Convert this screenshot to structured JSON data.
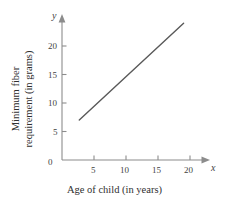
{
  "chart_data": {
    "type": "line",
    "title": "",
    "subtitle": "",
    "xlabel": "Age of child (in years)",
    "ylabel": "Minimum fiber requirement (in grams)",
    "x_var_symbol": "x",
    "y_var_symbol": "y",
    "xlim": [
      0,
      21.5
    ],
    "ylim": [
      0,
      25.5
    ],
    "x_ticks": [
      5,
      10,
      15,
      20
    ],
    "x_tick_labels": [
      "5",
      "10",
      "15",
      "20"
    ],
    "y_ticks": [
      5,
      10,
      15,
      20
    ],
    "y_tick_labels": [
      "5",
      "10",
      "15",
      "20"
    ],
    "origin_label": "0",
    "grid": false,
    "legend": null,
    "series": [
      {
        "name": "Minimum fiber requirement",
        "x": [
          2.7,
          19.0
        ],
        "values": [
          7.0,
          24.0
        ],
        "color": "#595959",
        "line_width": 1.4,
        "slope": 1.04,
        "intercept": 4.2
      }
    ],
    "annotations": []
  },
  "axes": {
    "axis_color": "#8c8c8c",
    "tick_color": "#8c8c8c",
    "arrow_x": "x-axis-arrow",
    "arrow_y": "y-axis-arrow"
  },
  "style": {
    "background": "#ffffff",
    "text_color": "#3a3a3a"
  }
}
